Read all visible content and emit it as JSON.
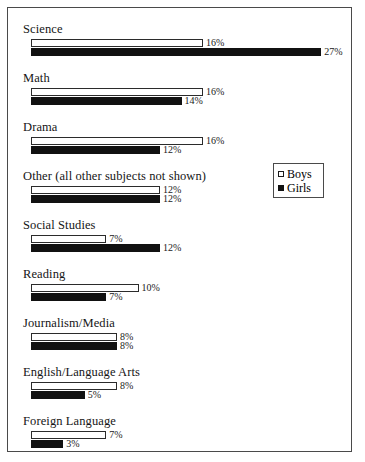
{
  "chart_data": {
    "type": "bar",
    "orientation": "horizontal",
    "title": "",
    "xlabel": "",
    "ylabel": "",
    "xlim": [
      0,
      27
    ],
    "grid": false,
    "legend_position": "middle-right",
    "categories": [
      "Science",
      "Math",
      "Drama",
      "Other (all other subjects not shown)",
      "Social Studies",
      "Reading",
      "Journalism/Media",
      "English/Language Arts",
      "Foreign Language"
    ],
    "series": [
      {
        "name": "Boys",
        "color": "#ffffff",
        "values": [
          16,
          16,
          16,
          12,
          7,
          10,
          8,
          8,
          7
        ],
        "labels": [
          "16%",
          "16%",
          "16%",
          "12%",
          "7%",
          "10%",
          "8%",
          "8%",
          "7%"
        ]
      },
      {
        "name": "Girls",
        "color": "#111111",
        "values": [
          27,
          14,
          12,
          12,
          12,
          7,
          8,
          5,
          3
        ],
        "labels": [
          "27%",
          "14%",
          "12%",
          "12%",
          "12%",
          "7%",
          "8%",
          "5%",
          "3%"
        ]
      }
    ]
  },
  "legend": {
    "entries": [
      {
        "label": "Boys",
        "swatch": "open-square"
      },
      {
        "label": "Girls",
        "swatch": "filled-square"
      }
    ]
  },
  "groups": [
    {
      "label": "Science",
      "boys_value": "16%",
      "girls_value": "27%"
    },
    {
      "label": "Math",
      "boys_value": "16%",
      "girls_value": "14%"
    },
    {
      "label": "Drama",
      "boys_value": "16%",
      "girls_value": "12%"
    },
    {
      "label": "Other (all other subjects not shown)",
      "boys_value": "12%",
      "girls_value": "12%"
    },
    {
      "label": "Social Studies",
      "boys_value": "7%",
      "girls_value": "12%"
    },
    {
      "label": "Reading",
      "boys_value": "10%",
      "girls_value": "7%"
    },
    {
      "label": "Journalism/Media",
      "boys_value": "8%",
      "girls_value": "8%"
    },
    {
      "label": "English/Language Arts",
      "boys_value": "8%",
      "girls_value": "5%"
    },
    {
      "label": "Foreign Language",
      "boys_value": "7%",
      "girls_value": "3%"
    }
  ]
}
